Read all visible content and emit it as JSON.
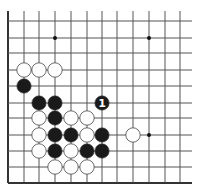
{
  "diagram": {
    "type": "go-board-fragment",
    "colors": {
      "background": "#ffffff",
      "grid": "#555555",
      "border": "#333333",
      "black_stone": "#1a1a1a",
      "white_stone": "#ffffff",
      "stone_outline": "#444444",
      "label_on_black": "#ffffff"
    },
    "grid": {
      "columns_x": [
        8,
        24,
        39,
        55,
        71,
        87,
        102,
        117,
        133,
        149,
        165,
        180
      ],
      "rows_y": [
        21,
        38,
        53,
        70,
        86,
        103,
        118,
        135,
        151,
        167,
        183
      ],
      "line_top": 11,
      "line_right": 192,
      "left_border_col": 0,
      "bottom_border_row": 10
    },
    "star_points": [
      {
        "col": 3,
        "row": 1
      },
      {
        "col": 9,
        "row": 1
      },
      {
        "col": 9,
        "row": 7
      }
    ],
    "stones": [
      {
        "color": "white",
        "col": 1,
        "row": 3
      },
      {
        "color": "white",
        "col": 2,
        "row": 3
      },
      {
        "color": "white",
        "col": 3,
        "row": 3
      },
      {
        "color": "black",
        "col": 1,
        "row": 4
      },
      {
        "color": "black",
        "col": 2,
        "row": 5
      },
      {
        "color": "black",
        "col": 3,
        "row": 5
      },
      {
        "color": "black",
        "col": 6,
        "row": 5,
        "label": "1"
      },
      {
        "color": "white",
        "col": 2,
        "row": 6
      },
      {
        "color": "black",
        "col": 3,
        "row": 6
      },
      {
        "color": "white",
        "col": 4,
        "row": 6
      },
      {
        "color": "white",
        "col": 5,
        "row": 6
      },
      {
        "color": "white",
        "col": 2,
        "row": 7
      },
      {
        "color": "black",
        "col": 3,
        "row": 7
      },
      {
        "color": "black",
        "col": 4,
        "row": 7
      },
      {
        "color": "white",
        "col": 5,
        "row": 7
      },
      {
        "color": "black",
        "col": 6,
        "row": 7
      },
      {
        "color": "white",
        "col": 8,
        "row": 7
      },
      {
        "color": "white",
        "col": 2,
        "row": 8
      },
      {
        "color": "black",
        "col": 3,
        "row": 8
      },
      {
        "color": "white",
        "col": 4,
        "row": 8
      },
      {
        "color": "black",
        "col": 5,
        "row": 8
      },
      {
        "color": "black",
        "col": 6,
        "row": 8
      },
      {
        "color": "white",
        "col": 3,
        "row": 9
      },
      {
        "color": "white",
        "col": 4,
        "row": 9
      },
      {
        "color": "white",
        "col": 5,
        "row": 9
      }
    ],
    "move_labels": [
      {
        "text": "1",
        "col": 6,
        "row": 5
      }
    ]
  }
}
